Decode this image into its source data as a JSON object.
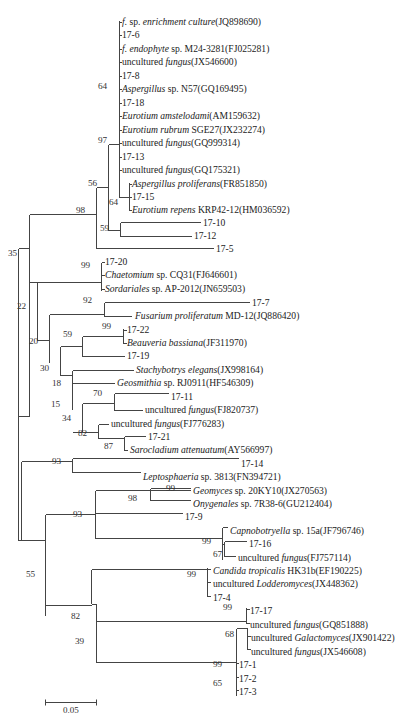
{
  "figure": {
    "type": "phylogenetic-tree",
    "scale_bar": {
      "label": "0.05",
      "x1": 45,
      "x2": 96,
      "y": 702
    }
  },
  "leaves": [
    {
      "id": "L0",
      "parts": [
        {
          "t": "f.",
          "i": true
        },
        {
          "t": " sp. ",
          "i": false
        },
        {
          "t": "enrichment culture",
          "i": true
        },
        {
          "t": "(JQ898690)",
          "i": false
        }
      ],
      "y": 22,
      "x": 121
    },
    {
      "id": "L1",
      "parts": [
        {
          "t": "17-6",
          "i": false
        }
      ],
      "y": 35,
      "x": 121
    },
    {
      "id": "L2",
      "parts": [
        {
          "t": "f. endophyte",
          "i": true
        },
        {
          "t": " sp. M24-3281(FJ025281)",
          "i": false
        }
      ],
      "y": 49,
      "x": 121
    },
    {
      "id": "L3",
      "parts": [
        {
          "t": "uncultured ",
          "i": false
        },
        {
          "t": "fungus",
          "i": true
        },
        {
          "t": "(JX546600)",
          "i": false
        }
      ],
      "y": 62,
      "x": 121
    },
    {
      "id": "L4",
      "parts": [
        {
          "t": "17-8",
          "i": false
        }
      ],
      "y": 76,
      "x": 121
    },
    {
      "id": "L5",
      "parts": [
        {
          "t": "Aspergillus",
          "i": true
        },
        {
          "t": " sp. N57(GQ169495)",
          "i": false
        }
      ],
      "y": 89,
      "x": 121
    },
    {
      "id": "L6",
      "parts": [
        {
          "t": "17-18",
          "i": false
        }
      ],
      "y": 103,
      "x": 121
    },
    {
      "id": "L7",
      "parts": [
        {
          "t": "Eurotium amstelodami",
          "i": true
        },
        {
          "t": "(AM159632)",
          "i": false
        }
      ],
      "y": 116,
      "x": 121
    },
    {
      "id": "L8",
      "parts": [
        {
          "t": "Eurotium rubrum",
          "i": true
        },
        {
          "t": " SGE27(JX232274)",
          "i": false
        }
      ],
      "y": 130,
      "x": 121
    },
    {
      "id": "L9",
      "parts": [
        {
          "t": "uncultured ",
          "i": false
        },
        {
          "t": "fungus",
          "i": true
        },
        {
          "t": "(GQ999314)",
          "i": false
        }
      ],
      "y": 143,
      "x": 121
    },
    {
      "id": "L10",
      "parts": [
        {
          "t": "17-13",
          "i": false
        }
      ],
      "y": 157,
      "x": 121
    },
    {
      "id": "L11",
      "parts": [
        {
          "t": "uncultured ",
          "i": false
        },
        {
          "t": "fungus",
          "i": true
        },
        {
          "t": "(GQ175321)",
          "i": false
        }
      ],
      "y": 170,
      "x": 121
    },
    {
      "id": "L12",
      "parts": [
        {
          "t": "Aspergillus proliferans",
          "i": true
        },
        {
          "t": "(FR851850)",
          "i": false
        }
      ],
      "y": 184,
      "x": 131
    },
    {
      "id": "L13",
      "parts": [
        {
          "t": "17-15",
          "i": false
        }
      ],
      "y": 197,
      "x": 131
    },
    {
      "id": "L14",
      "parts": [
        {
          "t": "Eurotium repens",
          "i": true
        },
        {
          "t": " KRP42-12(HM036592)",
          "i": false
        }
      ],
      "y": 210,
      "x": 131
    },
    {
      "id": "L15",
      "parts": [
        {
          "t": "17-10",
          "i": false
        }
      ],
      "y": 223,
      "x": 202
    },
    {
      "id": "L16",
      "parts": [
        {
          "t": "17-12",
          "i": false
        }
      ],
      "y": 236,
      "x": 193
    },
    {
      "id": "L17",
      "parts": [
        {
          "t": "17-5",
          "i": false
        }
      ],
      "y": 249,
      "x": 215
    },
    {
      "id": "L18",
      "parts": [
        {
          "t": "17-20",
          "i": false
        }
      ],
      "y": 262,
      "x": 104
    },
    {
      "id": "L19",
      "parts": [
        {
          "t": "Chaetomium",
          "i": true
        },
        {
          "t": " sp. CQ31(FJ646601)",
          "i": false
        }
      ],
      "y": 275,
      "x": 104
    },
    {
      "id": "L20",
      "parts": [
        {
          "t": "Sordariales",
          "i": true
        },
        {
          "t": " sp. AP-2012(JN659503)",
          "i": false
        }
      ],
      "y": 289,
      "x": 104
    },
    {
      "id": "L21",
      "parts": [
        {
          "t": "17-7",
          "i": false
        }
      ],
      "y": 303,
      "x": 251
    },
    {
      "id": "L22",
      "parts": [
        {
          "t": "Fusarium proliferatum",
          "i": true
        },
        {
          "t": " MD-12(JQ886420)",
          "i": false
        }
      ],
      "y": 316,
      "x": 134
    },
    {
      "id": "L23",
      "parts": [
        {
          "t": "17-22",
          "i": false
        }
      ],
      "y": 330,
      "x": 126
    },
    {
      "id": "L24",
      "parts": [
        {
          "t": "Beauveria bassiana",
          "i": true
        },
        {
          "t": "(JF311970)",
          "i": false
        }
      ],
      "y": 343,
      "x": 126
    },
    {
      "id": "L25",
      "parts": [
        {
          "t": "17-19",
          "i": false
        }
      ],
      "y": 356,
      "x": 126
    },
    {
      "id": "L26",
      "parts": [
        {
          "t": "Stachybotrys elegans",
          "i": true
        },
        {
          "t": "(JX998164)",
          "i": false
        }
      ],
      "y": 370,
      "x": 135
    },
    {
      "id": "L27",
      "parts": [
        {
          "t": "Geosmithia",
          "i": true
        },
        {
          "t": " sp. RJ0911(HF546309)",
          "i": false
        }
      ],
      "y": 383,
      "x": 116
    },
    {
      "id": "L28",
      "parts": [
        {
          "t": "17-11",
          "i": false
        }
      ],
      "y": 397,
      "x": 170
    },
    {
      "id": "L29",
      "parts": [
        {
          "t": "uncultured ",
          "i": false
        },
        {
          "t": "fungus",
          "i": true
        },
        {
          "t": "(FJ820737)",
          "i": false
        }
      ],
      "y": 410,
      "x": 144
    },
    {
      "id": "L30",
      "parts": [
        {
          "t": "uncultured ",
          "i": false
        },
        {
          "t": "fungus",
          "i": true
        },
        {
          "t": "(FJ776283)",
          "i": false
        }
      ],
      "y": 424,
      "x": 110
    },
    {
      "id": "L31",
      "parts": [
        {
          "t": "17-21",
          "i": false
        }
      ],
      "y": 437,
      "x": 147
    },
    {
      "id": "L32",
      "parts": [
        {
          "t": "Sarocladium attenuatum",
          "i": true
        },
        {
          "t": "(AY566997)",
          "i": false
        }
      ],
      "y": 450,
      "x": 129
    },
    {
      "id": "L33",
      "parts": [
        {
          "t": "17-14",
          "i": false
        }
      ],
      "y": 464,
      "x": 240
    },
    {
      "id": "L34",
      "parts": [
        {
          "t": "Leptosphaeria",
          "i": true
        },
        {
          "t": " sp. 3813(FN394721)",
          "i": false
        }
      ],
      "y": 477,
      "x": 142
    },
    {
      "id": "L35",
      "parts": [
        {
          "t": "Geomyces",
          "i": true
        },
        {
          "t": " sp. 20KY10(JX270563)",
          "i": false
        }
      ],
      "y": 491,
      "x": 192
    },
    {
      "id": "L36",
      "parts": [
        {
          "t": "Onygenales",
          "i": true
        },
        {
          "t": " sp. 7R38-6(GU212404)",
          "i": false
        }
      ],
      "y": 504,
      "x": 192
    },
    {
      "id": "L37",
      "parts": [
        {
          "t": "17-9",
          "i": false
        }
      ],
      "y": 517,
      "x": 184
    },
    {
      "id": "L38",
      "parts": [
        {
          "t": "Capnobotryella",
          "i": true
        },
        {
          "t": " sp. 15a(JF796746)",
          "i": false
        }
      ],
      "y": 531,
      "x": 229
    },
    {
      "id": "L39",
      "parts": [
        {
          "t": "17-16",
          "i": false
        }
      ],
      "y": 544,
      "x": 248
    },
    {
      "id": "L40",
      "parts": [
        {
          "t": "uncultured ",
          "i": false
        },
        {
          "t": "fungus",
          "i": true
        },
        {
          "t": "(FJ757114)",
          "i": false
        }
      ],
      "y": 558,
      "x": 237
    },
    {
      "id": "L41",
      "parts": [
        {
          "t": "Candida tropicalis",
          "i": true
        },
        {
          "t": " HK31b(EF190225)",
          "i": false
        }
      ],
      "y": 571,
      "x": 212
    },
    {
      "id": "L42",
      "parts": [
        {
          "t": "uncultured ",
          "i": false
        },
        {
          "t": "Lodderomyces",
          "i": true
        },
        {
          "t": "(JX448362)",
          "i": false
        }
      ],
      "y": 584,
      "x": 212
    },
    {
      "id": "L43",
      "parts": [
        {
          "t": "17-4",
          "i": false
        }
      ],
      "y": 598,
      "x": 212
    },
    {
      "id": "L44",
      "parts": [
        {
          "t": "17-17",
          "i": false
        }
      ],
      "y": 611,
      "x": 249
    },
    {
      "id": "L45",
      "parts": [
        {
          "t": "uncultured ",
          "i": false
        },
        {
          "t": "fungus",
          "i": true
        },
        {
          "t": "(GQ851888)",
          "i": false
        }
      ],
      "y": 625,
      "x": 249
    },
    {
      "id": "L46",
      "parts": [
        {
          "t": "uncultured ",
          "i": false
        },
        {
          "t": "Galactomyces",
          "i": true
        },
        {
          "t": "(JX901422)",
          "i": false
        }
      ],
      "y": 638,
      "x": 250
    },
    {
      "id": "L47",
      "parts": [
        {
          "t": "uncultured ",
          "i": false
        },
        {
          "t": "fungus",
          "i": true
        },
        {
          "t": "(JX546608)",
          "i": false
        }
      ],
      "y": 652,
      "x": 250
    },
    {
      "id": "L48",
      "parts": [
        {
          "t": "17-1",
          "i": false
        }
      ],
      "y": 665,
      "x": 238
    },
    {
      "id": "L49",
      "parts": [
        {
          "t": "17-2",
          "i": false
        }
      ],
      "y": 679,
      "x": 238
    },
    {
      "id": "L50",
      "parts": [
        {
          "t": "17-3",
          "i": false
        }
      ],
      "y": 692,
      "x": 238
    }
  ],
  "bootstrap": [
    {
      "v": "64",
      "x": 109,
      "y": 90
    },
    {
      "v": "97",
      "x": 109,
      "y": 144
    },
    {
      "v": "56",
      "x": 99,
      "y": 187
    },
    {
      "v": "64",
      "x": 120,
      "y": 206
    },
    {
      "v": "98",
      "x": 87,
      "y": 214
    },
    {
      "v": "59",
      "x": 111,
      "y": 232
    },
    {
      "v": "35",
      "x": 19,
      "y": 257
    },
    {
      "v": "99",
      "x": 92,
      "y": 269
    },
    {
      "v": "22",
      "x": 28,
      "y": 310
    },
    {
      "v": "92",
      "x": 94,
      "y": 304
    },
    {
      "v": "99",
      "x": 113,
      "y": 330
    },
    {
      "v": "20",
      "x": 40,
      "y": 345
    },
    {
      "v": "59",
      "x": 74,
      "y": 338
    },
    {
      "v": "30",
      "x": 51,
      "y": 372
    },
    {
      "v": "18",
      "x": 63,
      "y": 387
    },
    {
      "v": "70",
      "x": 104,
      "y": 397
    },
    {
      "v": "15",
      "x": 62,
      "y": 408
    },
    {
      "v": "34",
      "x": 73,
      "y": 422
    },
    {
      "v": "82",
      "x": 89,
      "y": 437
    },
    {
      "v": "87",
      "x": 115,
      "y": 450
    },
    {
      "v": "93",
      "x": 63,
      "y": 465
    },
    {
      "v": "99",
      "x": 177,
      "y": 492
    },
    {
      "v": "98",
      "x": 139,
      "y": 502
    },
    {
      "v": "93",
      "x": 84,
      "y": 518
    },
    {
      "v": "99",
      "x": 213,
      "y": 545
    },
    {
      "v": "67",
      "x": 224,
      "y": 558
    },
    {
      "v": "55",
      "x": 37,
      "y": 578
    },
    {
      "v": "99",
      "x": 198,
      "y": 578
    },
    {
      "v": "82",
      "x": 82,
      "y": 620
    },
    {
      "v": "99",
      "x": 234,
      "y": 611
    },
    {
      "v": "68",
      "x": 236,
      "y": 638
    },
    {
      "v": "39",
      "x": 86,
      "y": 645
    },
    {
      "v": "99",
      "x": 224,
      "y": 668
    },
    {
      "v": "65",
      "x": 224,
      "y": 687
    }
  ],
  "branches": [
    [
      119,
      20,
      119,
      172
    ],
    [
      119,
      22,
      121,
      22
    ],
    [
      119,
      35,
      121,
      35
    ],
    [
      119,
      49,
      121,
      49
    ],
    [
      119,
      62,
      121,
      62
    ],
    [
      119,
      76,
      121,
      76
    ],
    [
      119,
      89,
      121,
      89
    ],
    [
      119,
      103,
      121,
      103
    ],
    [
      119,
      116,
      121,
      116
    ],
    [
      119,
      130,
      121,
      130
    ],
    [
      119,
      143,
      121,
      143
    ],
    [
      119,
      157,
      121,
      157
    ],
    [
      119,
      170,
      121,
      170
    ],
    [
      129,
      182,
      129,
      210
    ],
    [
      129,
      184,
      131,
      184
    ],
    [
      129,
      197,
      131,
      197
    ],
    [
      129,
      210,
      131,
      210
    ],
    [
      119,
      143,
      119,
      197
    ],
    [
      119,
      197,
      129,
      197
    ],
    [
      108,
      144,
      108,
      230
    ],
    [
      108,
      144,
      119,
      144
    ],
    [
      120,
      222,
      120,
      236
    ],
    [
      108,
      230,
      120,
      230
    ],
    [
      120,
      222,
      200,
      222
    ],
    [
      120,
      236,
      191,
      236
    ],
    [
      96,
      187,
      96,
      248
    ],
    [
      96,
      187,
      108,
      187
    ],
    [
      96,
      248,
      213,
      248
    ],
    [
      29,
      214,
      29,
      355
    ],
    [
      29,
      214,
      96,
      214
    ],
    [
      101,
      262,
      101,
      290
    ],
    [
      101,
      275,
      104,
      275
    ],
    [
      101,
      262,
      104,
      262
    ],
    [
      101,
      289,
      104,
      289
    ],
    [
      37,
      282,
      37,
      340
    ],
    [
      37,
      282,
      101,
      282
    ],
    [
      104,
      302,
      104,
      316
    ],
    [
      104,
      302,
      249,
      302
    ],
    [
      104,
      316,
      131,
      316
    ],
    [
      123,
      328,
      123,
      343
    ],
    [
      123,
      330,
      126,
      330
    ],
    [
      123,
      343,
      126,
      343
    ],
    [
      82,
      336,
      82,
      356
    ],
    [
      82,
      336,
      123,
      336
    ],
    [
      82,
      356,
      124,
      356
    ],
    [
      49,
      314,
      49,
      362
    ],
    [
      49,
      314,
      104,
      314
    ],
    [
      60,
      346,
      60,
      375
    ],
    [
      60,
      346,
      82,
      346
    ],
    [
      72,
      370,
      72,
      409
    ],
    [
      72,
      370,
      133,
      370
    ],
    [
      72,
      383,
      114,
      383
    ],
    [
      114,
      393,
      114,
      410
    ],
    [
      114,
      393,
      168,
      393
    ],
    [
      114,
      410,
      142,
      410
    ],
    [
      82,
      403,
      82,
      432
    ],
    [
      82,
      403,
      114,
      403
    ],
    [
      98,
      424,
      98,
      438
    ],
    [
      98,
      424,
      108,
      424
    ],
    [
      124,
      436,
      124,
      450
    ],
    [
      124,
      436,
      145,
      436
    ],
    [
      124,
      450,
      127,
      450
    ],
    [
      98,
      438,
      124,
      438
    ],
    [
      72,
      432,
      98,
      432
    ],
    [
      60,
      375,
      72,
      375
    ],
    [
      37,
      340,
      49,
      340
    ],
    [
      18,
      248,
      18,
      416
    ],
    [
      18,
      248,
      29,
      248
    ],
    [
      18,
      416,
      29,
      416
    ],
    [
      29,
      282,
      29,
      416
    ],
    [
      29,
      282,
      37,
      282
    ],
    [
      21,
      461,
      21,
      540
    ],
    [
      21,
      474,
      21,
      474
    ],
    [
      72,
      458,
      72,
      472
    ],
    [
      72,
      458,
      238,
      458
    ],
    [
      72,
      472,
      140,
      472
    ],
    [
      21,
      461,
      72,
      461
    ],
    [
      95,
      490,
      95,
      513
    ],
    [
      95,
      490,
      150,
      490
    ],
    [
      95,
      513,
      182,
      513
    ],
    [
      150,
      488,
      150,
      500
    ],
    [
      150,
      488,
      190,
      488
    ],
    [
      150,
      500,
      190,
      500
    ],
    [
      150,
      490,
      190,
      490
    ],
    [
      45,
      514,
      45,
      615
    ],
    [
      45,
      514,
      95,
      514
    ],
    [
      222,
      527,
      222,
      559
    ],
    [
      222,
      527,
      227,
      527
    ],
    [
      224,
      541,
      224,
      556
    ],
    [
      224,
      541,
      246,
      541
    ],
    [
      224,
      556,
      235,
      556
    ],
    [
      222,
      544,
      224,
      544
    ],
    [
      95,
      513,
      95,
      538
    ],
    [
      95,
      538,
      222,
      538
    ],
    [
      91,
      569,
      91,
      603
    ],
    [
      91,
      569,
      207,
      569
    ],
    [
      207,
      567,
      207,
      596
    ],
    [
      207,
      569,
      210,
      569
    ],
    [
      207,
      582,
      210,
      582
    ],
    [
      207,
      596,
      210,
      596
    ],
    [
      96,
      604,
      96,
      662
    ],
    [
      96,
      604,
      91,
      604
    ],
    [
      246,
      607,
      246,
      623
    ],
    [
      246,
      609,
      249,
      609
    ],
    [
      246,
      623,
      249,
      623
    ],
    [
      96,
      621,
      246,
      621
    ],
    [
      236,
      628,
      236,
      695
    ],
    [
      236,
      628,
      247,
      628
    ],
    [
      247,
      627,
      247,
      649
    ],
    [
      247,
      636,
      250,
      636
    ],
    [
      247,
      649,
      250,
      649
    ],
    [
      236,
      663,
      238,
      663
    ],
    [
      236,
      677,
      238,
      677
    ],
    [
      236,
      690,
      238,
      690
    ],
    [
      96,
      662,
      236,
      662
    ],
    [
      45,
      605,
      91,
      605
    ],
    [
      21,
      540,
      45,
      540
    ],
    [
      18,
      416,
      18,
      540
    ],
    [
      18,
      540,
      21,
      540
    ]
  ]
}
